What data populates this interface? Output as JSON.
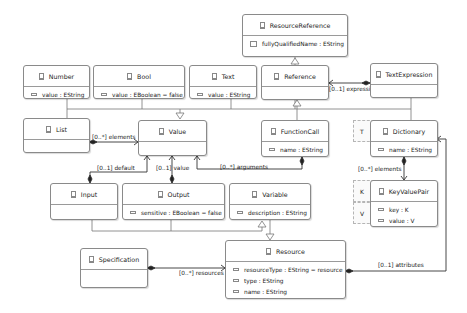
{
  "diagram": {
    "classes": {
      "resource_reference": {
        "name": "ResourceReference",
        "attributes": [
          "fullyQualifiedName : EString"
        ]
      },
      "number": {
        "name": "Number",
        "attributes": [
          "value : EString"
        ]
      },
      "bool": {
        "name": "Bool",
        "attributes": [
          "value : EBoolean = false"
        ]
      },
      "text": {
        "name": "Text",
        "attributes": [
          "value : EString"
        ]
      },
      "reference": {
        "name": "Reference",
        "attributes": []
      },
      "text_expression": {
        "name": "TextExpression",
        "attributes": []
      },
      "list": {
        "name": "List",
        "attributes": []
      },
      "value": {
        "name": "Value",
        "attributes": []
      },
      "function_call": {
        "name": "FunctionCall",
        "attributes": [
          "name : EString"
        ]
      },
      "dictionary": {
        "name": "Dictionary",
        "attributes": [
          "name : EString"
        ],
        "type_parameters": [
          "T"
        ]
      },
      "key_value_pair": {
        "name": "KeyValuePair",
        "attributes": [
          "key : K",
          "value : V"
        ],
        "type_parameters": [
          "K",
          "V"
        ]
      },
      "input": {
        "name": "Input",
        "attributes": []
      },
      "output": {
        "name": "Output",
        "attributes": [
          "sensitive : EBoolean = false"
        ]
      },
      "variable": {
        "name": "Variable",
        "attributes": [
          "description : EString"
        ]
      },
      "resource": {
        "name": "Resource",
        "attributes": [
          "resourceType : EString = resource",
          "type : EString",
          "name : EString"
        ]
      },
      "specification": {
        "name": "Specification",
        "attributes": []
      }
    },
    "associations": {
      "expression": "[0..1] expression",
      "elements_list": "[0..*] elements",
      "default": "[0..1] default",
      "value": "[0..1] value",
      "arguments": "[0..*] arguments",
      "elements_dict": "[0..*] elements",
      "resources": "[0..*] resources",
      "attributes": "[0..1] attributes"
    },
    "generalizations": [
      {
        "from": "ResourceReference",
        "to": "Reference"
      },
      {
        "from": "Number",
        "to": "Value"
      },
      {
        "from": "Bool",
        "to": "Value"
      },
      {
        "from": "Text",
        "to": "Value"
      },
      {
        "from": "Reference",
        "to": "Value"
      },
      {
        "from": "TextExpression",
        "to": "Value"
      },
      {
        "from": "List",
        "to": "Value"
      },
      {
        "from": "Dictionary",
        "to": "Value"
      },
      {
        "from": "FunctionCall",
        "to": "Reference"
      },
      {
        "from": "Input",
        "to": "Variable"
      },
      {
        "from": "Output",
        "to": "Variable"
      },
      {
        "from": "Variable",
        "to": "Resource"
      }
    ]
  }
}
